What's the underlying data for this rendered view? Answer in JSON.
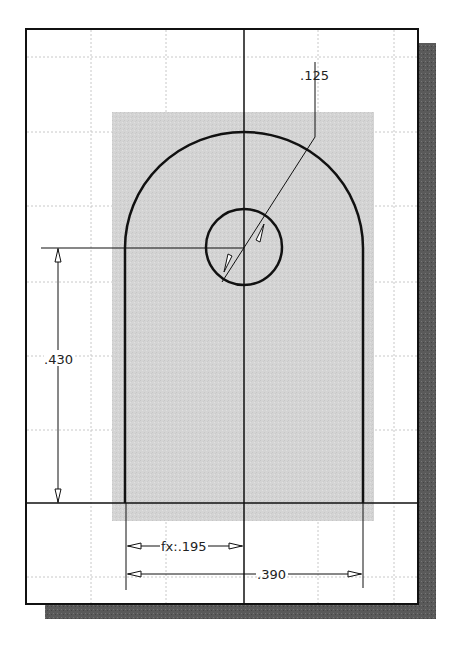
{
  "sketch": {
    "background": "#ffffff",
    "frame_color": "#111111",
    "shadow_color": "#555555",
    "grid_color": "#c8c8c8",
    "fill_color": "#d6d6d6",
    "line_color": "#111111"
  },
  "dimensions": {
    "hole_diameter": ".125",
    "center_height": ".430",
    "half_width": "fx:.195",
    "overall_width": ".390"
  }
}
